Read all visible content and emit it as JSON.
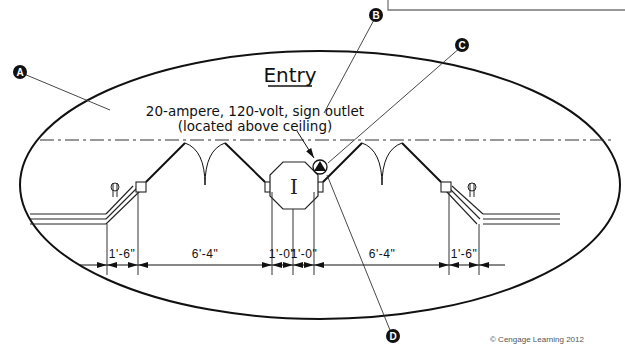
{
  "drawing": {
    "title": "Entry",
    "note_line1": "20-ampere, 120-volt, sign outlet",
    "note_line2": "(located above ceiling)",
    "center_fixture_label": "I",
    "copyright": "© Cengage Learning 2012"
  },
  "callouts": [
    {
      "id": "A",
      "label": "A"
    },
    {
      "id": "B",
      "label": "B"
    },
    {
      "id": "C",
      "label": "C"
    },
    {
      "id": "D",
      "label": "D"
    }
  ],
  "dimensions": [
    {
      "label": "1'-6\""
    },
    {
      "label": "6'-4\""
    },
    {
      "label": "1'-0\""
    },
    {
      "label": "1'-0\""
    },
    {
      "label": "6'-4\""
    },
    {
      "label": "1'-6\""
    }
  ],
  "colors": {
    "line": "#111111",
    "callout_fill": "#111111",
    "background": "#ffffff"
  }
}
